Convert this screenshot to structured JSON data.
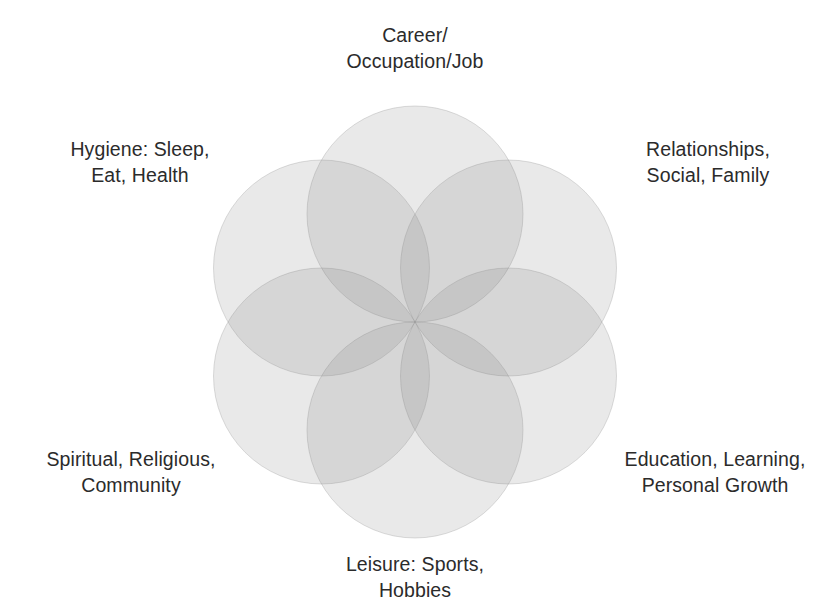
{
  "diagram": {
    "type": "venn-rosette",
    "circle_count": 6,
    "center": {
      "x": 415,
      "y": 322
    },
    "circle_radius": 108,
    "ring_radius": 108,
    "colors": {
      "circle_fill": "#787878",
      "circle_fill_opacity": "0.16",
      "circle_stroke": "#8d8d8d",
      "text": "#2b2b2b",
      "background": "#ffffff"
    },
    "circles": [
      {
        "id": "career",
        "angle_deg": 90,
        "cx": 415,
        "cy": 214
      },
      {
        "id": "relationships",
        "angle_deg": 30,
        "cx": 508.5,
        "cy": 268
      },
      {
        "id": "education",
        "angle_deg": -30,
        "cx": 508.5,
        "cy": 376
      },
      {
        "id": "leisure",
        "angle_deg": -90,
        "cx": 415,
        "cy": 430
      },
      {
        "id": "spiritual",
        "angle_deg": -150,
        "cx": 321.5,
        "cy": 376
      },
      {
        "id": "hygiene",
        "angle_deg": 150,
        "cx": 321.5,
        "cy": 268
      }
    ]
  },
  "labels": {
    "top": "Career/\nOccupation/Job",
    "top_left": "Hygiene: Sleep,\nEat, Health",
    "top_right": "Relationships,\nSocial, Family",
    "bottom_left": "Spiritual, Religious,\nCommunity",
    "bottom_right": "Education, Learning,\nPersonal Growth",
    "bottom": "Leisure: Sports,\nHobbies"
  }
}
